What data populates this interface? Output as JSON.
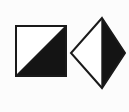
{
  "figure": {
    "background_color": "#fcfcfc",
    "width": 129,
    "height": 112,
    "ink_color": "#1a1a1a",
    "fill_color": "#141414",
    "blank_color": "#ffffff"
  },
  "shapes": [
    {
      "id": "square",
      "name": "half-filled-square",
      "label": "Square with filled lower-right triangle",
      "outline_color": "#1a1a1a",
      "fill_color": "#141414",
      "blank_color": "#ffffff",
      "stroke_width": 2,
      "bounds": {
        "x": 15,
        "y": 25,
        "width": 52,
        "height": 52
      },
      "corners": [
        {
          "x": 15,
          "y": 25
        },
        {
          "x": 67,
          "y": 25
        },
        {
          "x": 67,
          "y": 77
        },
        {
          "x": 15,
          "y": 77
        }
      ],
      "divider": {
        "type": "diagonal",
        "from": {
          "x": 15,
          "y": 77
        },
        "to": {
          "x": 67,
          "y": 25
        }
      },
      "filled_region": {
        "name": "lower-right-triangle",
        "points": "15,77 67,25 67,77"
      },
      "blank_region": {
        "name": "upper-left-triangle",
        "points": "15,25 67,25 15,77"
      }
    },
    {
      "id": "diamond",
      "name": "half-filled-diamond",
      "label": "Diamond with filled right half",
      "outline_color": "#1a1a1a",
      "fill_color": "#141414",
      "blank_color": "#ffffff",
      "stroke_width": 2,
      "bounds": {
        "x": 70,
        "y": 17,
        "width": 57,
        "height": 72
      },
      "vertices": {
        "top": {
          "x": 102,
          "y": 17
        },
        "right": {
          "x": 126,
          "y": 53
        },
        "bottom": {
          "x": 102,
          "y": 89
        },
        "left": {
          "x": 70,
          "y": 53
        }
      },
      "divider": {
        "type": "vertical",
        "from": {
          "x": 102,
          "y": 17
        },
        "to": {
          "x": 102,
          "y": 89
        }
      },
      "filled_region": {
        "name": "right-half",
        "points": "102,17 126,53 102,89"
      },
      "blank_region": {
        "name": "left-half",
        "points": "102,17 70,53 102,89"
      }
    }
  ]
}
